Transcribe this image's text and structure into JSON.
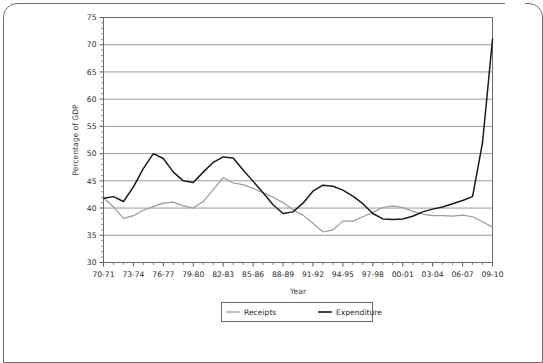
{
  "chart_data": {
    "type": "line",
    "title": "",
    "xlabel": "Year",
    "ylabel": "Percentage of GDP",
    "ylim": [
      30,
      75
    ],
    "ytick_step": 5,
    "yticks": [
      30,
      35,
      40,
      45,
      50,
      55,
      60,
      65,
      70,
      75
    ],
    "grid": true,
    "grid_axis": "y",
    "legend_position": "bottom-center",
    "x": [
      "70-71",
      "71-72",
      "72-73",
      "73-74",
      "74-75",
      "75-76",
      "76-77",
      "77-78",
      "78-79",
      "79-80",
      "80-81",
      "81-82",
      "82-83",
      "83-84",
      "84-85",
      "85-86",
      "86-87",
      "87-88",
      "88-89",
      "89-90",
      "90-91",
      "91-92",
      "92-93",
      "93-94",
      "94-95",
      "95-96",
      "96-97",
      "97-98",
      "98-99",
      "99-00",
      "00-01",
      "01-02",
      "02-03",
      "03-04",
      "04-05",
      "05-06",
      "06-07",
      "07-08",
      "08-09",
      "09-10"
    ],
    "xtick_labels": [
      "70-71",
      "73-74",
      "76-77",
      "79-80",
      "82-83",
      "85-86",
      "88-89",
      "91-92",
      "94-95",
      "97-98",
      "00-01",
      "03-04",
      "06-07",
      "09-10"
    ],
    "xtick_indices": [
      0,
      3,
      6,
      9,
      12,
      15,
      18,
      21,
      24,
      27,
      30,
      33,
      36,
      39
    ],
    "series": [
      {
        "name": "Receipts",
        "color": "#9a9a9a",
        "values": [
          41.9,
          40.2,
          38.1,
          38.6,
          39.6,
          40.3,
          40.9,
          41.1,
          40.4,
          40.0,
          41.2,
          43.4,
          45.6,
          44.6,
          44.3,
          43.6,
          42.8,
          42.0,
          41.0,
          39.7,
          38.7,
          37.2,
          35.6,
          36.0,
          37.6,
          37.6,
          38.4,
          39.2,
          40.1,
          40.4,
          40.1,
          39.4,
          38.9,
          38.6,
          38.6,
          38.5,
          38.7,
          38.4,
          37.5,
          36.5
        ]
      },
      {
        "name": "Expenditure",
        "color": "#1a1a1a",
        "values": [
          41.8,
          42.1,
          41.2,
          43.9,
          47.3,
          50.0,
          49.1,
          46.6,
          45.0,
          44.7,
          46.6,
          48.4,
          49.4,
          49.2,
          47.0,
          44.9,
          42.8,
          40.6,
          39.0,
          39.3,
          40.9,
          43.1,
          44.2,
          44.0,
          43.3,
          42.2,
          40.8,
          39.0,
          38.0,
          37.9,
          38.0,
          38.5,
          39.3,
          39.8,
          40.2,
          40.8,
          41.4,
          42.1,
          52.0,
          71.0
        ]
      }
    ]
  },
  "legend": {
    "items": [
      {
        "label": "Receipts",
        "color": "#9a9a9a"
      },
      {
        "label": "Expenditure",
        "color": "#1a1a1a"
      }
    ]
  },
  "axes": {
    "y_title": "Percentage of GDP",
    "x_title": "Year"
  }
}
